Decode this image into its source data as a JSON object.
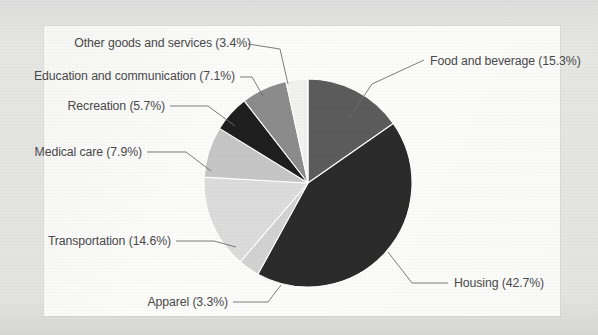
{
  "chart_data": {
    "type": "pie",
    "title": "",
    "subtitle": "",
    "xlabel": "",
    "ylabel": "",
    "legend_position": "none",
    "label_format": "{name} ({value}%)",
    "start_angle_deg": 0,
    "direction": "clockwise",
    "categories": [
      "Food and beverage",
      "Housing",
      "Apparel",
      "Transportation",
      "Medical care",
      "Recreation",
      "Education and communication",
      "Other goods and services"
    ],
    "values": [
      15.3,
      42.7,
      3.3,
      14.6,
      7.9,
      5.7,
      7.1,
      3.4
    ],
    "total": 100.0,
    "slices": [
      {
        "name": "Food and beverage",
        "value": 15.3,
        "label": "Food and beverage (15.3%)",
        "color": "#5c5c5c",
        "start_deg": 0.0,
        "end_deg": 55.08,
        "label_side": "right"
      },
      {
        "name": "Housing",
        "value": 42.7,
        "label": "Housing (42.7%)",
        "color": "#2b2b2b",
        "start_deg": 55.08,
        "end_deg": 208.8,
        "label_side": "right"
      },
      {
        "name": "Apparel",
        "value": 3.3,
        "label": "Apparel (3.3%)",
        "color": "#d2d2d2",
        "start_deg": 208.8,
        "end_deg": 220.68,
        "label_side": "left"
      },
      {
        "name": "Transportation",
        "value": 14.6,
        "label": "Transportation (14.6%)",
        "color": "#dcdcdc",
        "start_deg": 220.68,
        "end_deg": 273.24,
        "label_side": "left"
      },
      {
        "name": "Medical care",
        "value": 7.9,
        "label": "Medical care (7.9%)",
        "color": "#c6c6c6",
        "start_deg": 273.24,
        "end_deg": 301.68,
        "label_side": "left"
      },
      {
        "name": "Recreation",
        "value": 5.7,
        "label": "Recreation (5.7%)",
        "color": "#1f1f1f",
        "start_deg": 301.68,
        "end_deg": 322.2,
        "label_side": "left"
      },
      {
        "name": "Education and communication",
        "value": 7.1,
        "label": "Education and communication (7.1%)",
        "color": "#8c8c8c",
        "start_deg": 322.2,
        "end_deg": 347.76,
        "label_side": "left"
      },
      {
        "name": "Other goods and services",
        "value": 3.4,
        "label": "Other goods and services (3.4%)",
        "color": "#f2f2f0",
        "start_deg": 347.76,
        "end_deg": 360.0,
        "label_side": "left"
      }
    ],
    "geometry": {
      "center_x": 308,
      "center_y": 183,
      "radius": 104
    },
    "leader_lines": [
      {
        "name": "Food and beverage",
        "elbow": [
          [
            349,
            118
          ],
          [
            372,
            84
          ],
          [
            424,
            60
          ]
        ]
      },
      {
        "name": "Housing",
        "elbow": [
          [
            388,
            252
          ],
          [
            412,
            283
          ],
          [
            448,
            283
          ]
        ]
      },
      {
        "name": "Apparel",
        "elbow": [
          [
            281,
            285
          ],
          [
            268,
            302
          ],
          [
            233,
            302
          ]
        ]
      },
      {
        "name": "Transportation",
        "elbow": [
          [
            236,
            247
          ],
          [
            214,
            241
          ],
          [
            176,
            241
          ]
        ]
      },
      {
        "name": "Medical care",
        "elbow": [
          [
            211,
            171
          ],
          [
            186,
            152
          ],
          [
            147,
            152
          ]
        ]
      },
      {
        "name": "Recreation",
        "elbow": [
          [
            235,
            126
          ],
          [
            208,
            106
          ],
          [
            170,
            106
          ]
        ]
      },
      {
        "name": "Education and communication",
        "elbow": [
          [
            263,
            96
          ],
          [
            252,
            77
          ],
          [
            240,
            77
          ]
        ]
      },
      {
        "name": "Other goods and services",
        "elbow": [
          [
            288,
            84
          ],
          [
            280,
            49
          ],
          [
            248,
            44
          ]
        ]
      }
    ]
  },
  "labels": {
    "food_and_beverage": "Food and beverage (15.3%)",
    "housing": "Housing (42.7%)",
    "apparel": "Apparel (3.3%)",
    "transportation": "Transportation (14.6%)",
    "medical_care": "Medical care (7.9%)",
    "recreation": "Recreation (5.7%)",
    "education_and_communication": "Education and communication (7.1%)",
    "other_goods_and_services": "Other goods and services (3.4%)"
  },
  "style": {
    "panel_background": "#fbfbfa",
    "page_background": "#e4e4e2",
    "label_color": "#4a4a4a",
    "leader_color": "#6e6e6e",
    "slice_border": "#ffffff"
  }
}
